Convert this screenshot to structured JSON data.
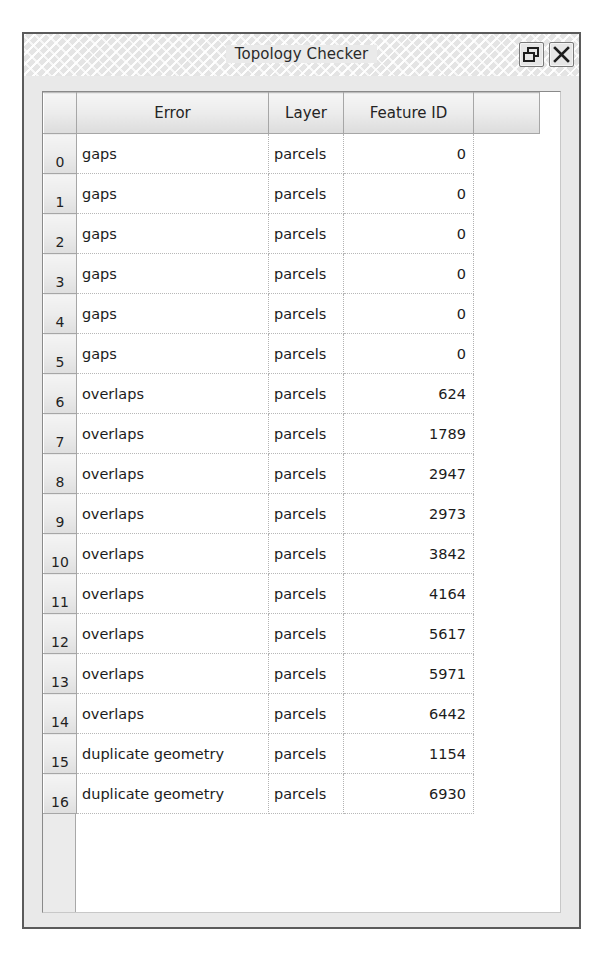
{
  "window": {
    "title": "Topology Checker",
    "buttons": [
      {
        "name": "float-button",
        "icon": "float-icon",
        "label": ""
      },
      {
        "name": "close-button",
        "icon": "close-icon",
        "label": ""
      }
    ]
  },
  "table": {
    "columns": [
      "",
      "Error",
      "Layer",
      "Feature ID",
      ""
    ],
    "rows": [
      {
        "index": "0",
        "error": "gaps",
        "layer": "parcels",
        "feature_id": "0"
      },
      {
        "index": "1",
        "error": "gaps",
        "layer": "parcels",
        "feature_id": "0"
      },
      {
        "index": "2",
        "error": "gaps",
        "layer": "parcels",
        "feature_id": "0"
      },
      {
        "index": "3",
        "error": "gaps",
        "layer": "parcels",
        "feature_id": "0"
      },
      {
        "index": "4",
        "error": "gaps",
        "layer": "parcels",
        "feature_id": "0"
      },
      {
        "index": "5",
        "error": "gaps",
        "layer": "parcels",
        "feature_id": "0"
      },
      {
        "index": "6",
        "error": "overlaps",
        "layer": "parcels",
        "feature_id": "624"
      },
      {
        "index": "7",
        "error": "overlaps",
        "layer": "parcels",
        "feature_id": "1789"
      },
      {
        "index": "8",
        "error": "overlaps",
        "layer": "parcels",
        "feature_id": "2947"
      },
      {
        "index": "9",
        "error": "overlaps",
        "layer": "parcels",
        "feature_id": "2973"
      },
      {
        "index": "10",
        "error": "overlaps",
        "layer": "parcels",
        "feature_id": "3842"
      },
      {
        "index": "11",
        "error": "overlaps",
        "layer": "parcels",
        "feature_id": "4164"
      },
      {
        "index": "12",
        "error": "overlaps",
        "layer": "parcels",
        "feature_id": "5617"
      },
      {
        "index": "13",
        "error": "overlaps",
        "layer": "parcels",
        "feature_id": "5971"
      },
      {
        "index": "14",
        "error": "overlaps",
        "layer": "parcels",
        "feature_id": "6442"
      },
      {
        "index": "15",
        "error": "duplicate geometry",
        "layer": "parcels",
        "feature_id": "1154"
      },
      {
        "index": "16",
        "error": "duplicate geometry",
        "layer": "parcels",
        "feature_id": "6930"
      }
    ]
  },
  "colors": {
    "window_frame": "#5b5b5b",
    "titlebar_bg": "#e4e4e4",
    "header_bg": "#ededed",
    "row_header_bg": "#ececec",
    "cell_bg": "#ffffff",
    "text": "#1c1c1c",
    "gridline": "#b3b3b3"
  }
}
